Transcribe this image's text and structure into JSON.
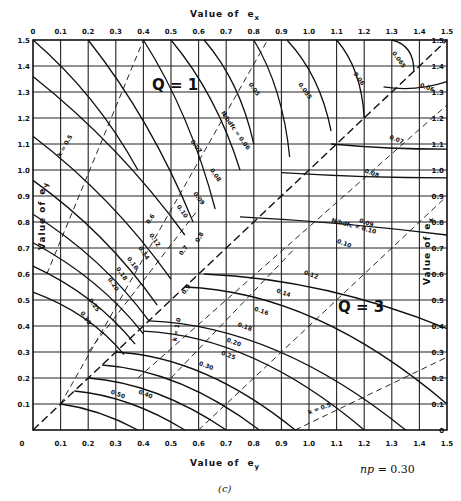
{
  "chart_data": {
    "type": "line",
    "panel_label": "(c)",
    "parameter": "np = 0.30",
    "top_axis": {
      "label": "Value of e_x",
      "label_text": "Value of",
      "label_var": "e",
      "label_sub": "x",
      "ticks": [
        "0",
        "0.1",
        "0.2",
        "0.3",
        "0.4",
        "0.5",
        "0.6",
        "0.7",
        "0.8",
        "0.9",
        "1.0",
        "1.1",
        "1.2",
        "1.3",
        "1.4",
        "1.5"
      ]
    },
    "bottom_axis": {
      "label": "Value of e_y",
      "label_text": "Value of",
      "label_var": "e",
      "label_sub": "y",
      "ticks": [
        "0",
        "0.1",
        "0.2",
        "0.3",
        "0.4",
        "0.5",
        "0.6",
        "0.7",
        "0.8",
        "0.9",
        "1.0",
        "1.1",
        "1.2",
        "1.3",
        "1.4",
        "1.5"
      ]
    },
    "left_axis": {
      "label": "Value of e_y",
      "label_text": "Value of",
      "label_var": "e",
      "label_sub": "y",
      "ticks": [
        "0",
        "0.1",
        "0.2",
        "0.3",
        "0.4",
        "0.5",
        "0.6",
        "0.7",
        "0.8",
        "0.9",
        "1.0",
        "1.1",
        "1.2",
        "1.3",
        "1.4",
        "1.5"
      ]
    },
    "right_axis": {
      "label": "Value of e_x",
      "label_text": "Value of",
      "label_var": "e",
      "label_sub": "x",
      "ticks": [
        "0",
        "0.1",
        "0.2",
        "0.3",
        "0.4",
        "0.5",
        "0.6",
        "0.7",
        "0.8",
        "0.9",
        "1.0",
        "1.1",
        "1.2",
        "1.3",
        "1.4",
        "1.5"
      ]
    },
    "xlim": [
      0,
      1.5
    ],
    "ylim": [
      0,
      1.5
    ],
    "grid": true,
    "regions": [
      {
        "name": "Q = 1",
        "x": 0.55,
        "y": 1.4
      },
      {
        "name": "Q = 3",
        "x": 1.15,
        "y": 0.5
      }
    ],
    "n_over_bdfc_curves_Q1": [
      {
        "label": "0.05",
        "value": 0.05
      },
      {
        "label": "0.055",
        "value": 0.055
      },
      {
        "label": "0.06",
        "value": 0.06
      },
      {
        "label": "0.065",
        "value": 0.065
      },
      {
        "label": "0.07",
        "value": 0.07
      },
      {
        "label": "0.08",
        "value": 0.08
      },
      {
        "label": "0.09",
        "value": 0.09
      },
      {
        "label": "0.10",
        "value": 0.1
      },
      {
        "label": "0.12",
        "value": 0.12
      },
      {
        "label": "0.14",
        "value": 0.14
      },
      {
        "label": "0.16",
        "value": 0.16
      },
      {
        "label": "0.18",
        "value": 0.18
      },
      {
        "label": "0.20",
        "value": 0.2
      },
      {
        "label": "0.25",
        "value": 0.25
      },
      {
        "label": "0.30",
        "value": 0.3
      }
    ],
    "n_over_bdfc_curves_Q3": [
      {
        "label": "0.06",
        "value": 0.06
      },
      {
        "label": "0.07",
        "value": 0.07
      },
      {
        "label": "0.08",
        "value": 0.08
      },
      {
        "label": "0.09",
        "value": 0.09
      },
      {
        "label": "0.10",
        "value": 0.1
      },
      {
        "label": "0.12",
        "value": 0.12
      },
      {
        "label": "0.14",
        "value": 0.14
      },
      {
        "label": "0.16",
        "value": 0.16
      },
      {
        "label": "0.18",
        "value": 0.18
      },
      {
        "label": "0.20",
        "value": 0.2
      },
      {
        "label": "0.25",
        "value": 0.25
      },
      {
        "label": "0.30",
        "value": 0.3
      },
      {
        "label": "0.40",
        "value": 0.4
      },
      {
        "label": "0.50",
        "value": 0.5
      }
    ],
    "k_lines": [
      {
        "label": "k = 0.5"
      },
      {
        "label": "0.6"
      },
      {
        "label": "0.7"
      },
      {
        "label": "0.8"
      },
      {
        "label": "0.9"
      },
      {
        "label": "k = 1.0"
      }
    ],
    "annotations": [
      "N / (b d fc) = 0.06",
      "N / (b d fc) = 0.10",
      "k = 0.5",
      "k = 1.0"
    ]
  },
  "labels": {
    "q1": "Q = 1",
    "q3": "Q = 3",
    "np": "np = 0.30",
    "panel": "(c)",
    "figure_caption": "Figure 13.24  Biaxial"
  }
}
